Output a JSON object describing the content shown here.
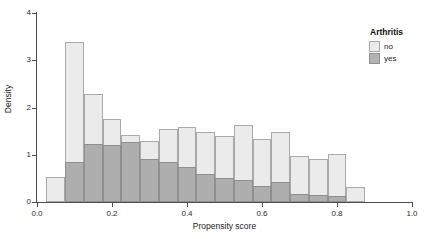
{
  "chart_data": {
    "type": "bar",
    "subtype": "overlapping-histogram",
    "title": "",
    "xlabel": "Propensity score",
    "ylabel": "Density",
    "xlim": [
      0.0,
      1.0
    ],
    "ylim": [
      0,
      4
    ],
    "xticks": [
      "0.0",
      "0.2",
      "0.4",
      "0.6",
      "0.8",
      "1.0"
    ],
    "xtick_values": [
      0.0,
      0.2,
      0.4,
      0.6,
      0.8,
      1.0
    ],
    "yticks": [
      "0",
      "1",
      "2",
      "3",
      "4"
    ],
    "ytick_values": [
      0,
      1,
      2,
      3,
      4
    ],
    "grid": false,
    "bin_width": 0.05,
    "bin_starts": [
      0.025,
      0.075,
      0.125,
      0.175,
      0.225,
      0.275,
      0.325,
      0.375,
      0.425,
      0.475,
      0.525,
      0.575,
      0.625,
      0.675,
      0.725,
      0.775,
      0.825
    ],
    "legend": {
      "title": "Arthritis",
      "position": "right",
      "entries": [
        {
          "label": "no",
          "color": "#ebebeb"
        },
        {
          "label": "yes",
          "color": "#b3b3b3"
        }
      ]
    },
    "series": [
      {
        "name": "no",
        "color": "#ebebeb",
        "values": [
          0.52,
          3.38,
          2.28,
          1.76,
          1.41,
          1.3,
          1.54,
          1.59,
          1.48,
          1.39,
          1.62,
          1.34,
          1.48,
          0.97,
          0.92,
          1.01,
          0.31
        ]
      },
      {
        "name": "yes",
        "color": "#b3b3b3",
        "values": [
          0.0,
          0.85,
          1.23,
          1.21,
          1.26,
          0.91,
          0.84,
          0.74,
          0.6,
          0.5,
          0.46,
          0.33,
          0.42,
          0.17,
          0.15,
          0.12,
          0.0
        ]
      }
    ]
  },
  "axes": {
    "x_title": "Propensity score",
    "y_title": "Density"
  }
}
